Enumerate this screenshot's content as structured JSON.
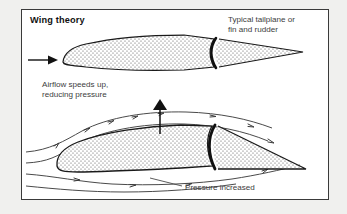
{
  "figure": {
    "title": "Wing theory",
    "labels": {
      "tailplane_line1": "Typical tailplane or",
      "tailplane_line2": "fin and rudder",
      "airflow_line1": "Airflow speeds up,",
      "airflow_line2": "reducing pressure",
      "pressure": "Pressure increased"
    },
    "colors": {
      "frame_border": "#3a3a3a",
      "page_background": "#f0f0ee",
      "panel_background": "#ffffff",
      "outline": "#1a1a1a",
      "streamline": "#4a4a4a",
      "stipple_dot": "#555555",
      "title_text": "#111111",
      "caption_text": "#3d3d3d"
    },
    "elements": {
      "top_section_name": "symmetric fin section",
      "bottom_section_name": "cambered wing section",
      "incoming_airflow_arrow": "horizontal arrow pointing right",
      "lift_arrow": "vertical arrow pointing up",
      "hinge_name": "control surface hinge line"
    }
  }
}
